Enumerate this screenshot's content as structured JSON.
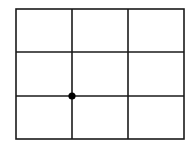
{
  "grid": {
    "rows": 3,
    "cols": 3,
    "left": 16,
    "top": 9,
    "right": 184,
    "bottom": 139,
    "v_lines": [
      72,
      128
    ],
    "h_lines": [
      52,
      96
    ],
    "line_color": "#1a1a1a",
    "stroke_width": 1.6
  },
  "point": {
    "x": 72,
    "y": 96,
    "radius": 3.6,
    "color": "#000000",
    "grid_intersection": {
      "col_line": 1,
      "row_line": 2
    }
  }
}
